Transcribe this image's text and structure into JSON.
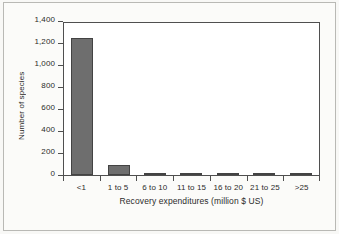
{
  "chart_data": {
    "type": "bar",
    "title": "",
    "subtitle": "",
    "xlabel": "Recovery expenditures (million $ US)",
    "ylabel": "Number of species",
    "categories": [
      "<1",
      "1 to 5",
      "6 to 10",
      "11 to 15",
      "16 to 20",
      "21 to 25",
      ">25"
    ],
    "values": [
      1265,
      90,
      20,
      10,
      5,
      5,
      5
    ],
    "series": [
      {
        "name": "Number of species",
        "values": [
          1265,
          90,
          20,
          10,
          5,
          5,
          5
        ]
      }
    ],
    "ylim": [
      0,
      1400
    ],
    "ytick_values": [
      1400,
      1200,
      1000,
      800,
      600,
      400,
      200,
      0
    ],
    "ytick_labels": [
      "1,400",
      "1,200",
      "1,000",
      "800",
      "600",
      "400",
      "200",
      "0"
    ],
    "grid": false,
    "legend": false,
    "legend_position": "none",
    "bar_color": "#6e6e6e",
    "bar_edge_color": "#434343",
    "axis_color": "#4f4f4f",
    "background_color": "#ffffff",
    "page_color": "#f8f8f6",
    "annotations": []
  }
}
